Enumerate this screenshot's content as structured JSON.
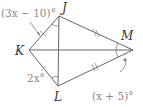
{
  "diagram": {
    "type": "kite",
    "vertices": {
      "J": {
        "label": "J",
        "x": 59,
        "y": 16
      },
      "K": {
        "label": "K",
        "x": 29,
        "y": 50
      },
      "L": {
        "label": "L",
        "x": 58,
        "y": 86
      },
      "M": {
        "label": "M",
        "x": 133,
        "y": 50
      }
    },
    "angle_labels": {
      "J": "(3x − 10)°",
      "L": "2x°",
      "M": "(x + 5)°"
    },
    "congruence": {
      "single_tick": [
        "KJ",
        "KL"
      ],
      "double_tick": [
        "JM",
        "LM"
      ]
    },
    "colors": {
      "line": "#666666",
      "label": "#8a8a8a",
      "vertex_label": "#333333"
    }
  }
}
